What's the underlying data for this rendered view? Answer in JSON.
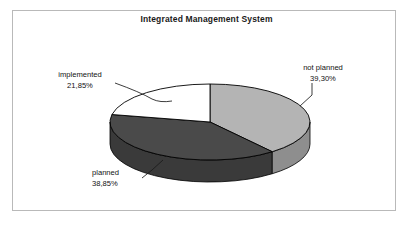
{
  "chart_data": {
    "type": "pie",
    "title": "Integrated Management System",
    "subtitle": "",
    "xlabel": "",
    "ylabel": "",
    "grid": false,
    "legend_position": "none",
    "three_d": true,
    "value_suffix": "%",
    "decimal_separator": ",",
    "start_angle_deg": 0,
    "direction": "clockwise",
    "categories": [
      "not planned",
      "planned",
      "implemented"
    ],
    "values": [
      39.3,
      38.85,
      21.85
    ],
    "labels": [
      "39,30%",
      "38,85%",
      "21,85%"
    ],
    "colors": [
      "#b4b4b4",
      "#4a4a4a",
      "#ffffff"
    ],
    "side_colors": [
      "#8e8e8e",
      "#3a3a3a",
      "#3a3a3a"
    ],
    "slices": [
      {
        "name": "not planned",
        "value": 39.3,
        "label": "39,30%",
        "color": "#b4b4b4"
      },
      {
        "name": "planned",
        "value": 38.85,
        "label": "38,85%",
        "color": "#4a4a4a"
      },
      {
        "name": "implemented",
        "value": 21.85,
        "label": "21,85%",
        "color": "#ffffff"
      }
    ]
  },
  "chart": {
    "title": "Integrated Management System",
    "frame_color": "#b9b9b9",
    "background": "#ffffff",
    "outline_color": "#000000"
  },
  "callouts": {
    "not_planned": {
      "name": "not planned",
      "value": "39,30%"
    },
    "implemented": {
      "name": "implemented",
      "value": "21,85%"
    },
    "planned": {
      "name": "planned",
      "value": "38,85%"
    }
  }
}
